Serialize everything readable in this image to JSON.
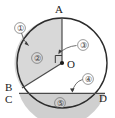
{
  "figure": {
    "background_color": "#ffffff",
    "outline_color": "#2b2b2b",
    "shade_color": "#d6d6d6",
    "label_color": "#1a1a1a",
    "callout_color": "#3a3a3a"
  },
  "points": [
    {
      "name": "A",
      "label": "A",
      "x": 62,
      "y": 18,
      "label_x": 59,
      "label_y": 13
    },
    {
      "name": "O",
      "label": "O",
      "x": 62,
      "y": 63,
      "label_x": 67,
      "label_y": 68
    },
    {
      "name": "B",
      "label": "B",
      "x": 22,
      "y": 88,
      "label_x": 9,
      "label_y": 90
    },
    {
      "name": "C",
      "label": "C",
      "x": 19,
      "y": 93,
      "label_x": 8,
      "label_y": 102
    },
    {
      "name": "D",
      "label": "D",
      "x": 105,
      "y": 93,
      "label_x": 99,
      "label_y": 102
    }
  ],
  "callouts": [
    {
      "id": "1",
      "label": "①",
      "points_to": "circle-arc-upper-left",
      "x": 20,
      "y": 28
    },
    {
      "id": "2",
      "label": "②",
      "points_to": "sector-AOB-region",
      "x": 37,
      "y": 58
    },
    {
      "id": "3",
      "label": "③",
      "points_to": "right-angle-mark-at-O",
      "x": 83,
      "y": 45
    },
    {
      "id": "4",
      "label": "④",
      "points_to": "chord-CD",
      "x": 88,
      "y": 79
    },
    {
      "id": "5",
      "label": "⑤",
      "points_to": "bottom-segment-region",
      "x": 60,
      "y": 103
    }
  ],
  "elements": {
    "circle_name": "circle-outline",
    "center_dot_name": "center-point-O",
    "radius_OA_name": "radius-OA",
    "radius_OB_name": "radius-OB",
    "chord_CD_name": "chord-CD",
    "sector_name": "shaded-sector-AOB",
    "segment_name": "shaded-segment-CD",
    "right_angle_name": "right-angle-mark"
  }
}
